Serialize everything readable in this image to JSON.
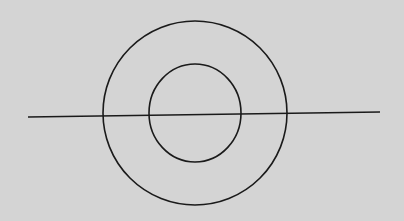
{
  "diagram": {
    "background": "#d4d4d4",
    "stroke_color": "#1a1a1a",
    "outer_circle": {
      "cx": 195,
      "cy": 113,
      "rx": 92,
      "ry": 92
    },
    "inner_circle": {
      "cx": 195,
      "cy": 113,
      "rx": 46,
      "ry": 49
    },
    "line": {
      "x1": 28,
      "y1": 117,
      "x2": 380,
      "y2": 112
    }
  }
}
